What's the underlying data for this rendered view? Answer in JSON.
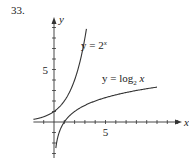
{
  "problem_number": "33.",
  "chart_data": {
    "type": "line",
    "title": "",
    "xlabel": "x",
    "ylabel": "y",
    "xlim": [
      -2,
      12.5
    ],
    "ylim": [
      -3,
      9.5
    ],
    "x_tick_labels": [
      {
        "value": 5,
        "label": "5"
      }
    ],
    "y_tick_labels": [
      {
        "value": 5,
        "label": "5"
      }
    ],
    "tick_spacing": 1,
    "series": [
      {
        "name": "y = 2^x",
        "label_text": "y = 2",
        "label_sup": "x",
        "function": "2^x",
        "x_range": [
          -2,
          3.15
        ]
      },
      {
        "name": "y = log_2 x",
        "label_text": "y = log",
        "label_sub": "2",
        "label_tail": " x",
        "function": "log2(x)",
        "x_range": [
          0.18,
          10
        ]
      }
    ]
  }
}
